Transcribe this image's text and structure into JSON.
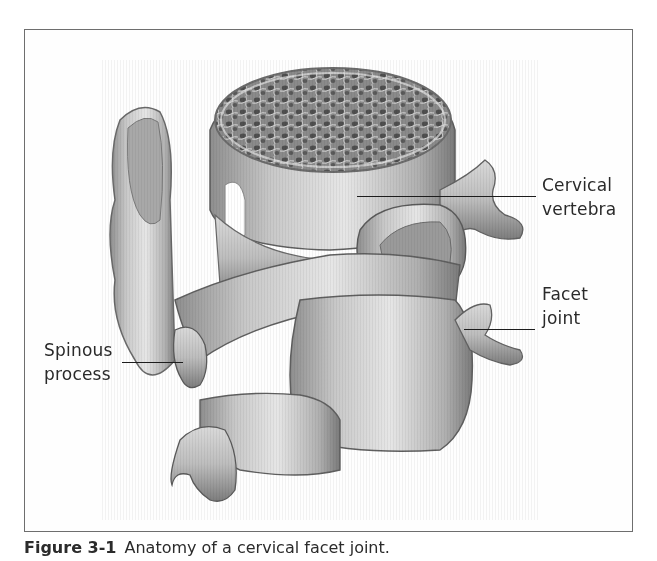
{
  "figure": {
    "frame_color": "#6e6e6e",
    "illustration": "Anatomy of cervical spine showing two stacked cervical vertebrae with vertebral body cross-section, facet joint and spinous process",
    "labels": [
      {
        "id": "cervical-vertebra",
        "lines": [
          "Cervical",
          "vertebra"
        ]
      },
      {
        "id": "facet-joint",
        "lines": [
          "Facet",
          "joint"
        ]
      },
      {
        "id": "spinous-process",
        "lines": [
          "Spinous",
          "process"
        ]
      }
    ],
    "caption": {
      "number": "Figure 3-1",
      "text": "Anatomy of a cervical facet joint."
    }
  }
}
